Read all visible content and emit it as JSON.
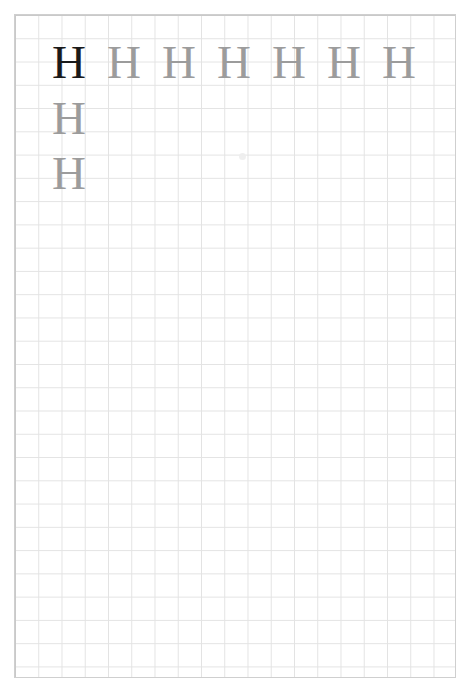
{
  "page": {
    "kind": "handwriting-practice-worksheet",
    "width": 473,
    "height": 687,
    "background_color": "#ffffff"
  },
  "grid": {
    "line_color": "#e3e3e3",
    "border_color": "#cfcfcf",
    "cell_size_px": 23,
    "columns": 19,
    "rows": 29,
    "left": 14,
    "top": 14,
    "width": 442,
    "height": 664
  },
  "colors": {
    "model_letter": "#1a1a1a",
    "tracing_letter": "#9c9c9c",
    "grid_line": "#e3e3e3",
    "page_background": "#ffffff"
  },
  "practice": {
    "letter": "H",
    "rows": [
      {
        "index": 1,
        "letters": [
          {
            "glyph": "H",
            "style": "model"
          },
          {
            "glyph": "H",
            "style": "tracing"
          },
          {
            "glyph": "H",
            "style": "tracing"
          },
          {
            "glyph": "H",
            "style": "tracing"
          },
          {
            "glyph": "H",
            "style": "tracing"
          },
          {
            "glyph": "H",
            "style": "tracing"
          },
          {
            "glyph": "H",
            "style": "tracing"
          }
        ]
      },
      {
        "index": 2,
        "letters": [
          {
            "glyph": "H",
            "style": "tracing"
          }
        ]
      },
      {
        "index": 3,
        "letters": [
          {
            "glyph": "H",
            "style": "tracing"
          }
        ]
      }
    ]
  },
  "artifacts": {
    "smudge": {
      "x": 239,
      "y": 153,
      "color": "#ededed"
    }
  }
}
